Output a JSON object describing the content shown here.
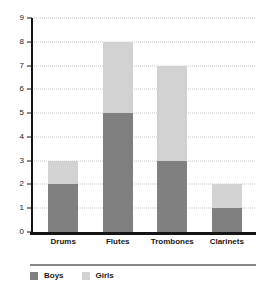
{
  "chart_data": {
    "type": "bar",
    "stacked": true,
    "title": "",
    "subtitle": "",
    "xlabel": "",
    "ylabel": "",
    "categories": [
      "Drums",
      "Flutes",
      "Trombones",
      "Clarinets"
    ],
    "series": [
      {
        "name": "Boys",
        "values": [
          2,
          5,
          3,
          1
        ],
        "color": "#808080"
      },
      {
        "name": "Girls",
        "values": [
          1,
          3,
          4,
          1
        ],
        "color": "#d2d2d2"
      }
    ],
    "totals": [
      3,
      8,
      7,
      2
    ],
    "ylim": [
      0,
      9
    ],
    "ytick_labels": [
      "0",
      "1",
      "2",
      "3",
      "4",
      "5",
      "6",
      "7",
      "8",
      "9"
    ],
    "ytick_values": [
      0,
      1,
      2,
      3,
      4,
      5,
      6,
      7,
      8,
      9
    ],
    "grid": true,
    "grid_axis": "y",
    "grid_style": "dotted",
    "grid_color": "#c8c8c8",
    "legend_position": "bottom-left",
    "axis_color": "#151515",
    "background_color": "#ffffff"
  },
  "legend": {
    "items": [
      {
        "label": "Boys",
        "color": "#808080"
      },
      {
        "label": "Girls",
        "color": "#d2d2d2"
      }
    ]
  }
}
